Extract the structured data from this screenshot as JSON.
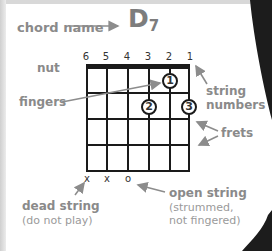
{
  "chord": {
    "label": "chord name",
    "name": "D",
    "sub": "7"
  },
  "strings": [
    "6",
    "5",
    "4",
    "3",
    "2",
    "1"
  ],
  "labels": {
    "nut": "nut",
    "fingers": "fingers",
    "string_numbers_1": "string",
    "string_numbers_2": "numbers",
    "frets": "frets",
    "dead_string": "dead string",
    "dead_string_note": "(do not play)",
    "open_string": "open string",
    "open_string_note_1": "(strummed,",
    "open_string_note_2": "not fingered)"
  },
  "string_marks": [
    "x",
    "x",
    "o",
    "",
    "",
    ""
  ],
  "fingers": [
    {
      "finger": "1",
      "string": 2,
      "fret": 1
    },
    {
      "finger": "2",
      "string": 3,
      "fret": 2
    },
    {
      "finger": "3",
      "string": 1,
      "fret": 2
    }
  ],
  "colors": {
    "label": "#8a8a8a",
    "grid": "#1a1a1a",
    "arrow": "#8c8c8c"
  }
}
